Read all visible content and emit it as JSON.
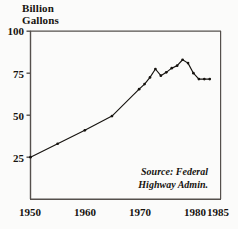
{
  "chart_data": {
    "type": "line",
    "title": "Billion Gallons",
    "title_line1": "Billion",
    "title_line2": "Gallons",
    "xlabel": "",
    "ylabel": "Billion Gallons",
    "xlim": [
      1950,
      1985
    ],
    "ylim": [
      0,
      100
    ],
    "x_ticks": [
      1950,
      1960,
      1970,
      1980,
      1985
    ],
    "x_tick_labels": [
      "1950",
      "1960",
      "1970",
      "1980",
      "1985"
    ],
    "y_ticks": [
      25,
      50,
      75,
      100
    ],
    "y_tick_labels": [
      "25",
      "50",
      "75",
      "100"
    ],
    "grid": false,
    "legend": null,
    "annotation_line1": "Source: Federal",
    "annotation_line2": "Highway Admin.",
    "marker": "filled-circle",
    "line_color": "#16130f",
    "axis_color": "#55504c",
    "background_color": "#fbfbfa",
    "series": [
      {
        "name": "Motor fuel consumption",
        "x": [
          1950,
          1955,
          1960,
          1965,
          1970,
          1971,
          1972,
          1973,
          1974,
          1975,
          1976,
          1977,
          1978,
          1979,
          1980,
          1981,
          1982,
          1983
        ],
        "values": [
          25,
          33,
          41,
          49.5,
          65.5,
          68.5,
          72.5,
          77.5,
          73.5,
          75.5,
          78,
          79.5,
          83,
          81,
          75,
          71.5,
          71.5,
          71.5
        ]
      }
    ]
  },
  "axes": {
    "y_tick_labels": [
      "100",
      "75",
      "50",
      "25"
    ],
    "x_tick_labels": [
      "1950",
      "1960",
      "1970",
      "1980",
      "1985"
    ]
  }
}
